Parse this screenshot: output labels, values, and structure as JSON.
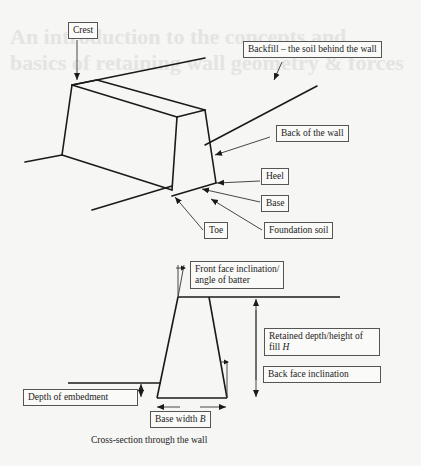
{
  "background_text": {
    "line1": "An introduction to the concepts and",
    "line2": "basics of retaining wall geometry & forces"
  },
  "perspective_view": {
    "labels": {
      "crest": "Crest",
      "backfill": "Backfill – the soil behind the wall",
      "back_of_wall": "Back of the wall",
      "heel": "Heel",
      "base": "Base",
      "toe": "Toe",
      "foundation_soil": "Foundation soil"
    }
  },
  "cross_section": {
    "labels": {
      "front_face_line1": "Front face inclination/",
      "front_face_line2": "angle of batter",
      "retained_depth_line1": "Retained depth/height of",
      "retained_depth_line2_prefix": "fill ",
      "retained_depth_symbol": "H",
      "back_face": "Back face inclination",
      "depth_of_embedment": "Depth of embedment",
      "base_width_prefix": "Base width ",
      "base_width_symbol": "B"
    },
    "caption": "Cross-section through the wall"
  },
  "colors": {
    "line": "#1a1a1a",
    "background": "#f6f6f4",
    "label_border": "#555555"
  }
}
